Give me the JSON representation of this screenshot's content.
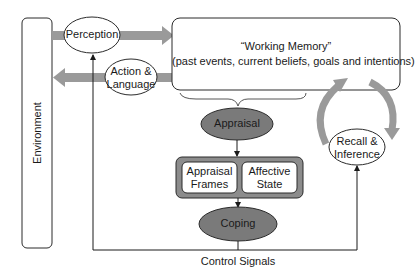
{
  "diagram": {
    "environment": {
      "label": "Environment"
    },
    "perception": {
      "label": "Perception"
    },
    "action_language": {
      "line1": "Action &",
      "line2": "Language"
    },
    "working_memory": {
      "title": "“Working Memory”",
      "subtitle": "(past events, current beliefs, goals and intentions)"
    },
    "appraisal": {
      "label": "Appraisal"
    },
    "appraisal_frames": {
      "line1": "Appraisal",
      "line2": "Frames"
    },
    "affective_state": {
      "line1": "Affective",
      "line2": "State"
    },
    "coping": {
      "label": "Coping"
    },
    "recall_inference": {
      "line1": "Recall &",
      "line2": "Inference"
    },
    "control_signals": {
      "label": "Control Signals"
    },
    "colors": {
      "stroke": "#2b2b2b",
      "dark_node_fill": "#7a7a7a",
      "grey_arrow": "#9a9a9a",
      "frame_fill": "#8c8c8c",
      "white": "#ffffff"
    }
  }
}
